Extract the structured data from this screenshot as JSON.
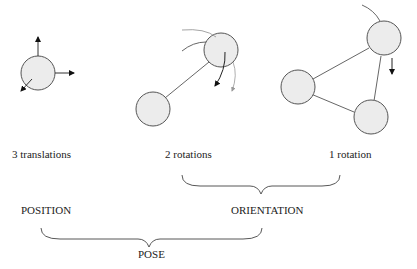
{
  "labels": {
    "translations": "3 translations",
    "two_rotations": "2 rotations",
    "one_rotation": "1 rotation",
    "position": "POSITION",
    "orientation": "ORIENTATION",
    "pose": "POSE"
  },
  "colors": {
    "node_fill": "#ececec",
    "stroke": "#555555",
    "faint_stroke": "#9a9a9a",
    "arrow": "#111111"
  },
  "figures": [
    {
      "name": "translations",
      "nodes": 1,
      "arrows": [
        "up",
        "right",
        "down-left"
      ]
    },
    {
      "name": "two-rotations",
      "nodes": 2,
      "links": 1,
      "rotation_arcs": 2
    },
    {
      "name": "one-rotation",
      "nodes": 3,
      "links": 3,
      "rotation_arcs": 1
    }
  ]
}
